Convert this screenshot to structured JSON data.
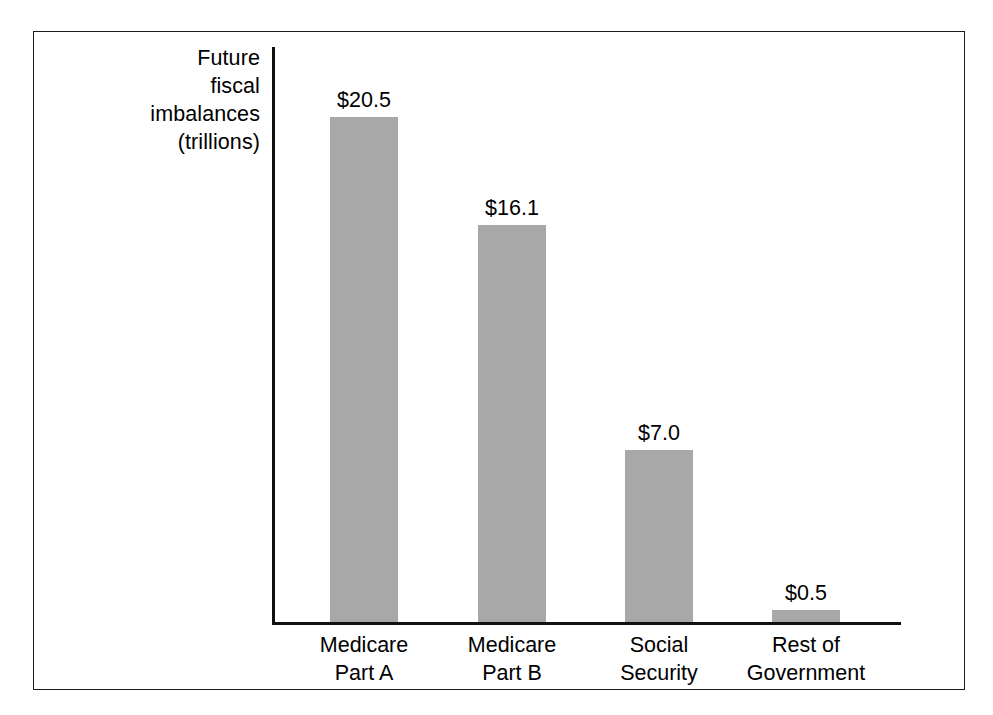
{
  "chart_data": {
    "type": "bar",
    "title": "",
    "xlabel": "",
    "ylabel": "Future\nfiscal\nimbalances\n(trillions)",
    "categories": [
      "Medicare\nPart A",
      "Medicare\nPart B",
      "Social\nSecurity",
      "Rest of\nGovernment"
    ],
    "values": [
      20.5,
      16.1,
      7.0,
      0.5
    ],
    "value_labels": [
      "$20.5",
      "$16.1",
      "$7.0",
      "$0.5"
    ],
    "ylim": [
      0,
      23.5
    ],
    "grid": false,
    "legend": null,
    "bar_color": "#a8a8a8",
    "axis_color": "#111111",
    "frame_color": "#1b1b1b",
    "text_color": "#000000"
  }
}
